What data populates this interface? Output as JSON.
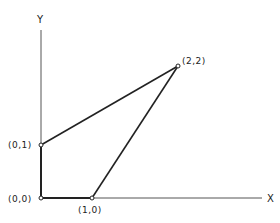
{
  "diagram": {
    "axes": {
      "x_label": "X",
      "y_label": "Y"
    },
    "points": [
      {
        "id": "p00",
        "label": "(0,0)"
      },
      {
        "id": "p01",
        "label": "(0,1)"
      },
      {
        "id": "p10",
        "label": "(1,0)"
      },
      {
        "id": "p22",
        "label": "(2,2)"
      }
    ],
    "edges": [
      [
        "(0,0)",
        "(0,1)"
      ],
      [
        "(0,1)",
        "(2,2)"
      ],
      [
        "(2,2)",
        "(1,0)"
      ],
      [
        "(1,0)",
        "(0,0)"
      ]
    ],
    "colors": {
      "line": "#222222",
      "background": "#ffffff"
    }
  }
}
